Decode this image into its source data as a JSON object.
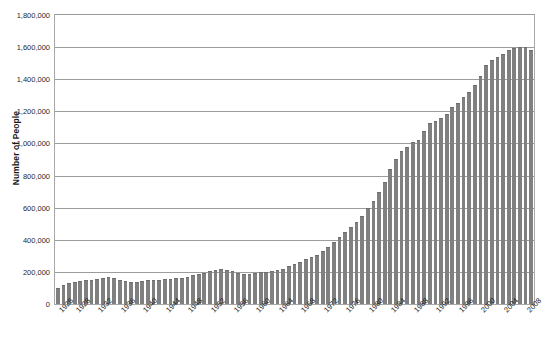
{
  "chart_data": {
    "type": "bar",
    "title": "",
    "xlabel": "",
    "ylabel": "Number of People",
    "ylim": [
      0,
      1800000
    ],
    "ytick_step": 200000,
    "ytick_labels": [
      "0",
      "200,000",
      "400,000",
      "600,000",
      "800,000",
      "1,000,000",
      "1,200,000",
      "1,400,000",
      "1,600,000",
      "1,800,000"
    ],
    "ytick_values": [
      0,
      200000,
      400000,
      600000,
      800000,
      1000000,
      1200000,
      1400000,
      1600000,
      1800000
    ],
    "grid": true,
    "legend": "none",
    "xtick_interval_years": 4,
    "xtick_labels": [
      "1925",
      "1928",
      "1932",
      "1936",
      "1940",
      "1944",
      "1948",
      "1952",
      "1956",
      "1960",
      "1964",
      "1968",
      "1972",
      "1976",
      "1980",
      "1984",
      "1988",
      "1992",
      "1996",
      "2000",
      "2004",
      "2008"
    ],
    "bar_color": "#808080",
    "categories": [
      "1925",
      "1926",
      "1927",
      "1928",
      "1929",
      "1930",
      "1931",
      "1932",
      "1933",
      "1934",
      "1935",
      "1936",
      "1937",
      "1938",
      "1939",
      "1940",
      "1941",
      "1942",
      "1943",
      "1944",
      "1945",
      "1946",
      "1947",
      "1948",
      "1949",
      "1950",
      "1951",
      "1952",
      "1953",
      "1954",
      "1955",
      "1956",
      "1957",
      "1958",
      "1959",
      "1960",
      "1961",
      "1962",
      "1963",
      "1964",
      "1965",
      "1966",
      "1967",
      "1968",
      "1969",
      "1970",
      "1971",
      "1972",
      "1973",
      "1974",
      "1975",
      "1976",
      "1977",
      "1978",
      "1979",
      "1980",
      "1981",
      "1982",
      "1983",
      "1984",
      "1985",
      "1986",
      "1987",
      "1988",
      "1989",
      "1990",
      "1991",
      "1992",
      "1993",
      "1994",
      "1995",
      "1996",
      "1997",
      "1998",
      "1999",
      "2000",
      "2001",
      "2002",
      "2003",
      "2004",
      "2005",
      "2006",
      "2007",
      "2008",
      "2009"
    ],
    "values": [
      100000,
      118000,
      128000,
      140000,
      142000,
      148000,
      150000,
      158000,
      165000,
      170000,
      160000,
      148000,
      142000,
      138000,
      140000,
      146000,
      148000,
      150000,
      152000,
      155000,
      158000,
      160000,
      163000,
      168000,
      178000,
      185000,
      195000,
      205000,
      212000,
      215000,
      212000,
      208000,
      196000,
      188000,
      190000,
      196000,
      198000,
      200000,
      205000,
      210000,
      220000,
      235000,
      248000,
      262000,
      278000,
      290000,
      305000,
      330000,
      358000,
      385000,
      420000,
      450000,
      480000,
      512000,
      550000,
      595000,
      640000,
      700000,
      760000,
      840000,
      905000,
      950000,
      980000,
      1010000,
      1020000,
      1080000,
      1130000,
      1140000,
      1160000,
      1185000,
      1230000,
      1250000,
      1290000,
      1320000,
      1365000,
      1420000,
      1490000,
      1520000,
      1540000,
      1555000,
      1580000,
      1595000,
      1600000,
      1600000,
      1580000
    ]
  }
}
